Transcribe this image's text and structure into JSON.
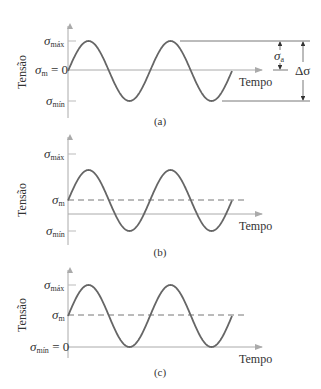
{
  "figure": {
    "panels": [
      {
        "id": "a",
        "caption": "(a)",
        "y_axis_label": "Tensão",
        "x_axis_label": "Tempo",
        "levels": {
          "max": 1,
          "mean": 0,
          "min": -1,
          "zero": 0
        },
        "labels": {
          "max": "máx",
          "mean": "m",
          "mean_suffix": " = 0",
          "min": "mín"
        },
        "mean_dashed": false,
        "annotations": {
          "amplitude": "a",
          "range": "Δσ"
        },
        "cycles": 2
      },
      {
        "id": "b",
        "caption": "(b)",
        "y_axis_label": "Tensão",
        "x_axis_label": "Tempo",
        "levels": {
          "max": 1.6,
          "mean": 0.5,
          "min": -0.5,
          "zero": 0
        },
        "labels": {
          "max": "máx",
          "mean": "m",
          "mean_suffix": "",
          "min": "mín"
        },
        "mean_dashed": true,
        "cycles": 2
      },
      {
        "id": "c",
        "caption": "(c)",
        "y_axis_label": "Tensão",
        "x_axis_label": "Tempo",
        "levels": {
          "max": 2,
          "mean": 1,
          "min": 0,
          "zero": 0
        },
        "labels": {
          "max": "máx",
          "mean": "m",
          "mean_suffix": "",
          "min": "mín",
          "min_suffix": " = 0"
        },
        "mean_dashed": true,
        "cycles": 2
      }
    ],
    "sigma_symbol": "σ"
  }
}
